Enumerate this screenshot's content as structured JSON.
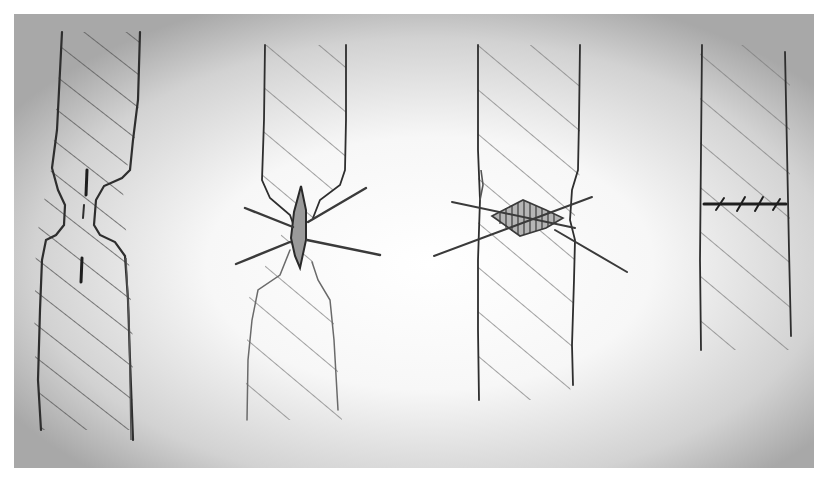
{
  "figure": {
    "kind": "hand-drawn pencil sketch",
    "panels": [
      {
        "id": 1,
        "description": "Hatched strip narrowing to a pinched neck with a vertical crack line through the center"
      },
      {
        "id": 2,
        "description": "Hatched strip with narrowed neck, a spindle-shaped lesion at the pinch, and radiating lines"
      },
      {
        "id": 3,
        "description": "Hatched strip with a horizontally hatched diamond lesion and crossing lines"
      },
      {
        "id": 4,
        "description": "Straight hatched strip with a horizontal stitched/sutured line across it"
      }
    ]
  },
  "colors": {
    "paper_edge": "#a9a9a9",
    "paper_center": "#ffffff",
    "pencil": "#2e2e2e",
    "pencil_light": "#6a6a6a",
    "hatch": "#7a7a7a"
  }
}
